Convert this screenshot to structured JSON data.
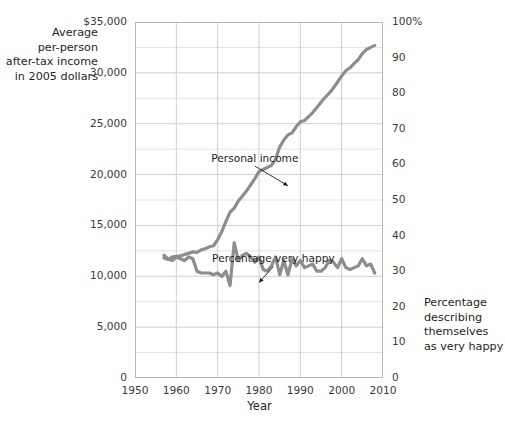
{
  "chart_data": {
    "type": "line",
    "title": "",
    "xlabel": "Year",
    "ylabel_left": "Average\nper-person\nafter-tax income\nin 2005 dollars",
    "ylabel_right": "Percentage\ndescribing\nthemselves\nas very happy",
    "xlim": [
      1950,
      2010
    ],
    "xticks": [
      1950,
      1960,
      1970,
      1980,
      1990,
      2000,
      2010
    ],
    "xticklabels": [
      "1950",
      "1960",
      "1970",
      "1980",
      "1990",
      "2000",
      "2010"
    ],
    "ylim_left": [
      0,
      35000
    ],
    "yticks_left": [
      0,
      5000,
      10000,
      15000,
      20000,
      25000,
      30000,
      35000
    ],
    "yticklabels_left": [
      "0",
      "5,000",
      "10,000",
      "15,000",
      "20,000",
      "25,000",
      "30,000",
      "$35,000"
    ],
    "ylim_right": [
      0,
      100
    ],
    "yticks_right": [
      0,
      10,
      20,
      30,
      40,
      50,
      60,
      70,
      80,
      90,
      100
    ],
    "yticklabels_right": [
      "0",
      "10",
      "20",
      "30",
      "40",
      "50",
      "60",
      "70",
      "80",
      "90",
      "100%"
    ],
    "grid": true,
    "legend": "none",
    "annotations": [
      {
        "name": "personal-income",
        "text": "Personal income",
        "x": 1979.0,
        "y_frac": 0.615,
        "leader_to_x": 1987.0,
        "leader_to_y_frac": 0.54
      },
      {
        "name": "percentage-very-happy",
        "text": "Percentage very happy",
        "x": 1983.5,
        "y_frac": 0.333,
        "leader_to_x": 1980.0,
        "leader_to_y_frac": 0.268
      }
    ],
    "series": [
      {
        "name": "Personal income",
        "axis": "left",
        "units": "2005 dollars",
        "color": "#8d8d8d",
        "x": [
          1957,
          1958,
          1959,
          1960,
          1961,
          1962,
          1963,
          1964,
          1965,
          1966,
          1967,
          1968,
          1969,
          1970,
          1971,
          1972,
          1973,
          1974,
          1975,
          1976,
          1977,
          1978,
          1979,
          1980,
          1981,
          1982,
          1983,
          1984,
          1985,
          1986,
          1987,
          1988,
          1989,
          1990,
          1991,
          1992,
          1993,
          1994,
          1995,
          1996,
          1997,
          1998,
          1999,
          2000,
          2001,
          2002,
          2003,
          2004,
          2005,
          2006,
          2007,
          2008
        ],
        "values": [
          11800,
          11650,
          11900,
          11950,
          12000,
          12150,
          12250,
          12400,
          12350,
          12600,
          12700,
          12900,
          13000,
          13600,
          14400,
          15400,
          16300,
          16700,
          17400,
          17900,
          18400,
          19000,
          19600,
          20300,
          20500,
          20700,
          20900,
          21500,
          22700,
          23400,
          23900,
          24100,
          24700,
          25200,
          25300,
          25700,
          26100,
          26600,
          27100,
          27600,
          28000,
          28500,
          29100,
          29700,
          30200,
          30500,
          30900,
          31300,
          31900,
          32300,
          32500,
          32700
        ]
      },
      {
        "name": "Percentage very happy",
        "axis": "right",
        "units": "percent",
        "color": "#8d8d8d",
        "x": [
          1957,
          1958,
          1959,
          1960,
          1961,
          1962,
          1963,
          1964,
          1965,
          1966,
          1967,
          1968,
          1969,
          1970,
          1971,
          1972,
          1973,
          1974,
          1975,
          1976,
          1977,
          1978,
          1979,
          1980,
          1981,
          1982,
          1983,
          1984,
          1985,
          1986,
          1987,
          1988,
          1989,
          1990,
          1991,
          1992,
          1993,
          1994,
          1995,
          1996,
          1997,
          1998,
          1999,
          2000,
          2001,
          2002,
          2003,
          2004,
          2005,
          2006,
          2007,
          2008
        ],
        "values": [
          34.5,
          33.5,
          33.0,
          34.0,
          33.5,
          33.0,
          34.0,
          33.5,
          30.0,
          29.5,
          29.5,
          29.5,
          29.0,
          29.5,
          28.5,
          30.0,
          26.0,
          38.0,
          33.0,
          34.5,
          35.0,
          34.0,
          32.5,
          34.0,
          30.5,
          30.0,
          31.5,
          34.0,
          29.0,
          33.0,
          29.0,
          33.5,
          31.5,
          33.0,
          31.0,
          31.5,
          32.0,
          30.0,
          30.0,
          31.0,
          33.0,
          32.5,
          31.0,
          33.5,
          31.0,
          30.5,
          31.0,
          31.5,
          33.5,
          31.5,
          32.0,
          29.5
        ]
      }
    ]
  },
  "axis_style": {
    "grid_color": "#cfcfcf",
    "minor_grid_color": "#e2e2e2",
    "frame_color": "#b8b8b8",
    "tick_color": "#9a9a9a",
    "text_color": "#231f20",
    "background": "#ffffff"
  }
}
